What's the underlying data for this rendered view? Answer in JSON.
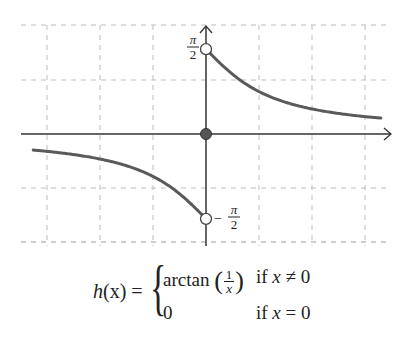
{
  "chart_data": {
    "type": "line",
    "title": "",
    "function": "h(x) = arctan(1/x) for x != 0, 0 for x = 0",
    "xlabel": "",
    "ylabel": "",
    "xlim": [
      -3.5,
      3.5
    ],
    "ylim": [
      -2.1,
      2.1
    ],
    "grid": true,
    "grid_style": "dashed",
    "grid_spacing": 1,
    "series": [
      {
        "name": "h(x), x<0",
        "x": [
          -3.26,
          -3,
          -2.5,
          -2,
          -1.5,
          -1,
          -0.75,
          -0.5,
          -0.25,
          0
        ],
        "y": [
          -0.298,
          -0.322,
          -0.381,
          -0.464,
          -0.588,
          -0.785,
          -0.927,
          -1.107,
          -1.326,
          -1.5708
        ]
      },
      {
        "name": "h(x), x>0",
        "x": [
          0,
          0.25,
          0.5,
          0.75,
          1,
          1.5,
          2,
          2.5,
          3,
          3.3
        ],
        "y": [
          1.5708,
          1.326,
          1.107,
          0.927,
          0.785,
          0.588,
          0.464,
          0.381,
          0.322,
          0.295
        ]
      }
    ],
    "points": [
      {
        "x": 0,
        "y": 1.5708,
        "style": "open",
        "label": "π/2"
      },
      {
        "x": 0,
        "y": -1.5708,
        "style": "open",
        "label": "−π/2"
      },
      {
        "x": 0,
        "y": 0,
        "style": "filled"
      }
    ],
    "tick_labels": {
      "y_top": {
        "num": "π",
        "den": "2",
        "sign": ""
      },
      "y_bottom": {
        "num": "π",
        "den": "2",
        "sign": "−"
      }
    },
    "colors": {
      "curve": "#5a5a5a",
      "axis": "#333333",
      "grid": "#bdbdbd",
      "filled_point": "#555555"
    }
  },
  "formula": {
    "lhs_name": "h",
    "lhs_arg": "(x) =",
    "case1_func": "arctan",
    "case1_num": "1",
    "case1_den": "x",
    "case1_cond_if": "if",
    "case1_cond_var": "x",
    "case1_cond_rel": "≠ 0",
    "case2_value": "0",
    "case2_cond_if": "if",
    "case2_cond_var": "x",
    "case2_cond_rel": "= 0"
  }
}
